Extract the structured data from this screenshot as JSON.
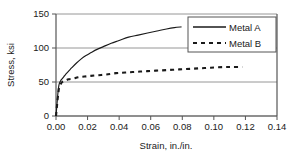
{
  "chart_data": {
    "type": "line",
    "title": "",
    "xlabel": "Strain, in./in.",
    "ylabel": "Stress, ksi",
    "xlim": [
      0.0,
      0.14
    ],
    "ylim": [
      0,
      150
    ],
    "xticks": [
      "0.00",
      "0.02",
      "0.04",
      "0.06",
      "0.08",
      "0.10",
      "0.12",
      "0.14"
    ],
    "xtick_values": [
      0.0,
      0.02,
      0.04,
      0.06,
      0.08,
      0.1,
      0.12,
      0.14
    ],
    "yticks": [
      "0",
      "50",
      "100",
      "150"
    ],
    "ytick_values": [
      0,
      50,
      100,
      150
    ],
    "grid": "horizontal",
    "legend_position": "top-right",
    "series": [
      {
        "name": "Metal A",
        "style": "solid",
        "color": "#1a1a1a",
        "x": [
          0.0,
          0.0005,
          0.001,
          0.0015,
          0.002,
          0.003,
          0.004,
          0.005,
          0.006,
          0.008,
          0.01,
          0.013,
          0.016,
          0.019,
          0.022,
          0.026,
          0.03,
          0.035,
          0.04,
          0.046,
          0.052,
          0.058,
          0.064,
          0.07,
          0.075,
          0.0795
        ],
        "y": [
          0,
          14,
          28,
          40,
          47,
          52,
          55,
          58,
          61,
          66,
          71,
          78,
          84,
          89,
          93,
          98,
          102,
          107,
          111,
          116,
          119,
          122,
          125,
          128,
          130,
          131
        ]
      },
      {
        "name": "Metal B",
        "style": "dashed",
        "color": "#1a1a1a",
        "x": [
          0.0,
          0.0005,
          0.001,
          0.0015,
          0.002,
          0.003,
          0.004,
          0.006,
          0.008,
          0.011,
          0.014,
          0.018,
          0.022,
          0.027,
          0.032,
          0.038,
          0.044,
          0.051,
          0.058,
          0.066,
          0.074,
          0.082,
          0.09,
          0.098,
          0.106,
          0.112,
          0.118
        ],
        "y": [
          0,
          12,
          24,
          34,
          42,
          47,
          50,
          52,
          54,
          55,
          57,
          58,
          59,
          60,
          61,
          63,
          64,
          65,
          66,
          67,
          68,
          69,
          70,
          71,
          72,
          72,
          72
        ]
      }
    ]
  },
  "legend": {
    "items": [
      {
        "label": "Metal A",
        "style": "solid"
      },
      {
        "label": "Metal B",
        "style": "dashed"
      }
    ]
  },
  "axes": {
    "x_title": "Strain, in./in.",
    "y_title": "Stress, ksi"
  },
  "colors": {
    "line": "#1a1a1a",
    "grid": "#8a8a8a",
    "axis": "#555555",
    "background": "#ffffff"
  }
}
